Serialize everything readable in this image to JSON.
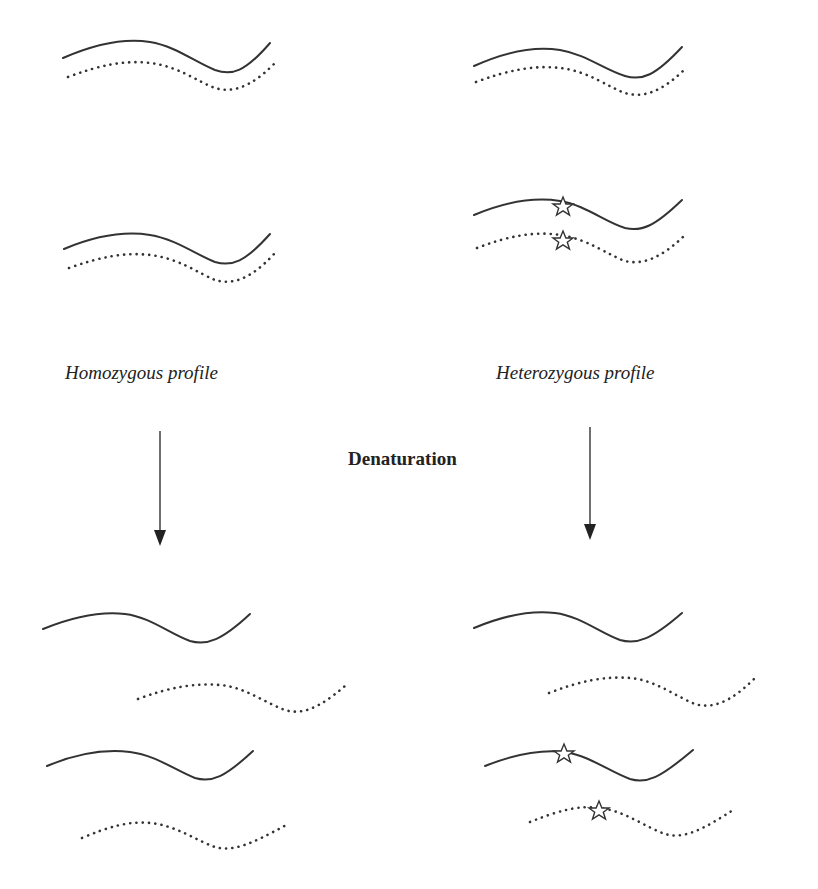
{
  "diagram": {
    "left_column": {
      "label": "Homozygous profile",
      "mutation_present": false
    },
    "right_column": {
      "label": "Heterozygous profile",
      "mutation_present": true
    },
    "process_label": "Denaturation",
    "strand_legend": {
      "solid": "sense strand",
      "dotted": "complementary strand",
      "star": "mutation-marker"
    },
    "colors": {
      "ink": "#333333",
      "background": "#ffffff"
    }
  }
}
